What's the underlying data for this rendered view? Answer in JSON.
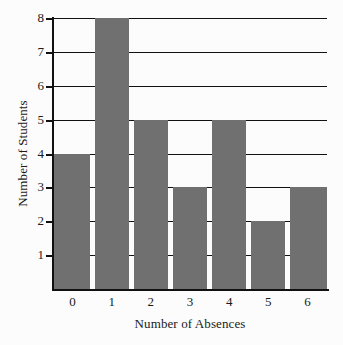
{
  "chart_data": {
    "type": "bar",
    "title": "",
    "xlabel": "Number of Absences",
    "ylabel": "Number of Students",
    "categories": [
      "0",
      "1",
      "2",
      "3",
      "4",
      "5",
      "6"
    ],
    "values": [
      4,
      8,
      5,
      3,
      5,
      2,
      3
    ],
    "series": [
      {
        "name": "Number of Students",
        "values": [
          4,
          8,
          5,
          3,
          5,
          2,
          3
        ]
      }
    ],
    "x_tick_labels": [
      "0",
      "1",
      "2",
      "3",
      "4",
      "5",
      "6"
    ],
    "y_tick_labels": [
      "1",
      "2",
      "3",
      "4",
      "5",
      "6",
      "7",
      "8"
    ],
    "y_tick_values": [
      1,
      2,
      3,
      4,
      5,
      6,
      7,
      8
    ],
    "ylim": [
      0,
      8
    ],
    "xlim": [
      -0.5,
      6.5
    ],
    "grid": true,
    "grid_axis": "y",
    "legend": false,
    "legend_position": "none",
    "bar_color": "#707070",
    "gridline_color": "#111111",
    "axis_color": "#111111",
    "background_color": "#fcfcfc",
    "text_color": "#1a1a1a"
  }
}
